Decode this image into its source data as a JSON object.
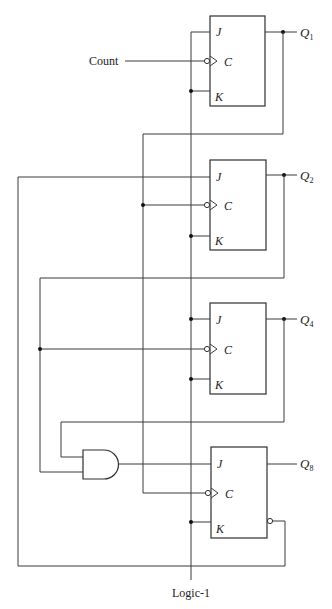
{
  "diagram": {
    "inputs": {
      "clock_label": "Count",
      "rail_label": "Logic-1"
    },
    "flip_flops": [
      {
        "id": "ff1",
        "pins": {
          "j": "J",
          "c": "C",
          "k": "K"
        },
        "output": {
          "q": "Q",
          "sub": "1"
        }
      },
      {
        "id": "ff2",
        "pins": {
          "j": "J",
          "c": "C",
          "k": "K"
        },
        "output": {
          "q": "Q",
          "sub": "2"
        }
      },
      {
        "id": "ff4",
        "pins": {
          "j": "J",
          "c": "C",
          "k": "K"
        },
        "output": {
          "q": "Q",
          "sub": "4"
        }
      },
      {
        "id": "ff8",
        "pins": {
          "j": "J",
          "c": "C",
          "k": "K"
        },
        "output": {
          "q": "Q",
          "sub": "8"
        }
      }
    ],
    "gates": [
      {
        "type": "AND",
        "inputs": 2,
        "drives": "ff8.J"
      }
    ],
    "colors": {
      "line": "#3a3a3a",
      "background": "#ffffff"
    }
  }
}
